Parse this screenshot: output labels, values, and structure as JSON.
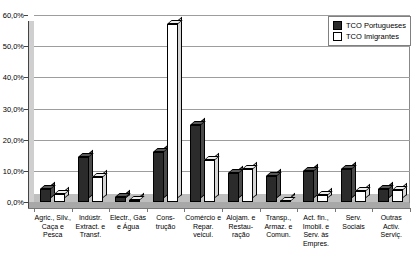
{
  "chart_data": {
    "type": "bar",
    "title": "",
    "xlabel": "",
    "ylabel": "",
    "ylim": [
      0,
      60
    ],
    "ytick_labels": [
      "0,0%",
      "10,0%",
      "20,0%",
      "30,0%",
      "40,0%",
      "50,0%",
      "60,0%"
    ],
    "ytick_values": [
      0,
      10,
      20,
      30,
      40,
      50,
      60
    ],
    "grid": true,
    "legend_position": "top-right",
    "categories": [
      "Agric., Silv.,\nCaça e\nPesca",
      "Indústr.\nExtract. e\nTransf.",
      "Electr., Gás\ne Água",
      "Cons-\ntrução",
      "Comércio e\nRepar.\nveicul.",
      "Alojam. e\nRestau-\nração",
      "Transp.,\nArmaz. e\nComun.",
      "Act. fin.,\nImobil. e\nServ. às\nEmpres.",
      "Serv.\nSociais",
      "Outras\nActiv.\nServiç."
    ],
    "series": [
      {
        "name": "TCO Portugueses",
        "color": "#2b2b2b",
        "values": [
          4.3,
          14.5,
          1.6,
          16.2,
          24.6,
          9.4,
          8.2,
          10.0,
          10.6,
          4.1
        ]
      },
      {
        "name": "TCO Imigrantes",
        "color": "#ffffff",
        "values": [
          2.6,
          8.0,
          0.5,
          57.0,
          13.6,
          10.6,
          0.4,
          2.2,
          3.6,
          3.9
        ]
      }
    ]
  },
  "legend": {
    "items": [
      {
        "label": "TCO Portugueses",
        "swatch": "dark"
      },
      {
        "label": "TCO Imigrantes",
        "swatch": "light"
      }
    ]
  }
}
